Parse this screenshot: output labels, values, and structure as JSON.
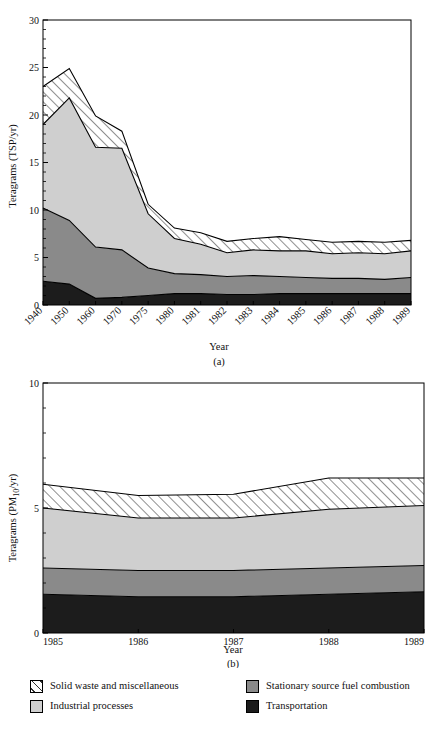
{
  "figure": {
    "panel_a_tag": "(a)",
    "panel_b_tag": "(b)"
  },
  "legend": {
    "items": [
      {
        "key": "solid_waste",
        "label": "Solid waste and miscellaneous",
        "color": "#ffffff",
        "pattern": "diagonal-hatch"
      },
      {
        "key": "industrial",
        "label": "Industrial processes",
        "color": "#cfcfcf",
        "pattern": "solid"
      },
      {
        "key": "stationary",
        "label": "Stationary source fuel combustion",
        "color": "#8a8a8a",
        "pattern": "solid"
      },
      {
        "key": "transport",
        "label": "Transportation",
        "color": "#1c1c1c",
        "pattern": "solid"
      }
    ]
  },
  "chart_data": [
    {
      "id": "panel-a",
      "type": "area",
      "stacked": true,
      "title": "",
      "xlabel": "Year",
      "ylabel": "Teragrams (TSP/yr)",
      "panel_label": "(a)",
      "categories": [
        "1940",
        "1950",
        "1960",
        "1970",
        "1975",
        "1980",
        "1981",
        "1982",
        "1983",
        "1984",
        "1985",
        "1986",
        "1987",
        "1988",
        "1989"
      ],
      "x_tick_labels": [
        "1940",
        "1950",
        "1960",
        "1970",
        "1975",
        "1980",
        "1981",
        "1982",
        "1983",
        "1984",
        "1985",
        "1986",
        "1987",
        "1988",
        "1989"
      ],
      "y_tick_labels": [
        "0",
        "5",
        "10",
        "15",
        "20",
        "25",
        "30"
      ],
      "y_ticks": [
        0,
        5,
        10,
        15,
        20,
        25,
        30
      ],
      "ylim": [
        0,
        30
      ],
      "grid": false,
      "legend_position": "below-figure",
      "series": [
        {
          "name": "Transportation",
          "key": "transport",
          "color": "#1c1c1c",
          "values": [
            2.5,
            2.2,
            0.7,
            0.8,
            1.0,
            1.2,
            1.2,
            1.1,
            1.1,
            1.2,
            1.2,
            1.2,
            1.2,
            1.2,
            1.2
          ]
        },
        {
          "name": "Stationary source fuel combustion",
          "key": "stationary",
          "color": "#8a8a8a",
          "values": [
            7.7,
            6.7,
            5.4,
            5.0,
            2.9,
            2.1,
            2.0,
            1.9,
            2.0,
            1.8,
            1.7,
            1.6,
            1.6,
            1.5,
            1.7
          ]
        },
        {
          "name": "Industrial processes",
          "key": "industrial",
          "color": "#cfcfcf",
          "values": [
            8.8,
            12.9,
            10.5,
            10.7,
            5.7,
            3.7,
            3.2,
            2.5,
            2.7,
            2.7,
            2.8,
            2.6,
            2.7,
            2.7,
            2.8
          ]
        },
        {
          "name": "Solid waste and miscellaneous",
          "key": "solid_waste",
          "color": "#ffffff",
          "values": [
            4.0,
            3.1,
            3.3,
            1.8,
            1.0,
            1.1,
            1.2,
            1.2,
            1.2,
            1.5,
            1.2,
            1.2,
            1.2,
            1.2,
            1.1
          ]
        }
      ],
      "cumulative_totals": [
        23.0,
        24.9,
        19.9,
        18.3,
        10.6,
        8.1,
        7.6,
        6.7,
        7.0,
        7.2,
        6.9,
        6.6,
        6.7,
        6.6,
        6.8
      ]
    },
    {
      "id": "panel-b",
      "type": "area",
      "stacked": true,
      "title": "",
      "xlabel": "Year",
      "ylabel": "Teragrams (PM10/yr)",
      "ylabel_base": "Teragrams (PM",
      "ylabel_sub": "10",
      "ylabel_tail": "/yr)",
      "panel_label": "(b)",
      "categories": [
        "1985",
        "1986",
        "1987",
        "1988",
        "1989"
      ],
      "x_tick_labels": [
        "1985",
        "1986",
        "1987",
        "1988",
        "1989"
      ],
      "y_tick_labels": [
        "0",
        "5",
        "10"
      ],
      "y_ticks": [
        0,
        5,
        10
      ],
      "ylim": [
        0,
        10
      ],
      "grid": false,
      "legend_position": "below-figure",
      "series": [
        {
          "name": "Transportation",
          "key": "transport",
          "color": "#1c1c1c",
          "values": [
            1.55,
            1.45,
            1.45,
            1.55,
            1.65
          ]
        },
        {
          "name": "Stationary source fuel combustion",
          "key": "stationary",
          "color": "#8a8a8a",
          "values": [
            1.05,
            1.05,
            1.05,
            1.05,
            1.05
          ]
        },
        {
          "name": "Industrial processes",
          "key": "industrial",
          "color": "#cfcfcf",
          "values": [
            2.4,
            2.1,
            2.1,
            2.35,
            2.4
          ]
        },
        {
          "name": "Solid waste and miscellaneous",
          "key": "solid_waste",
          "color": "#ffffff",
          "values": [
            0.95,
            0.9,
            0.95,
            1.25,
            1.1
          ]
        }
      ],
      "cumulative_totals": [
        5.95,
        5.5,
        5.55,
        6.2,
        6.2
      ]
    }
  ]
}
